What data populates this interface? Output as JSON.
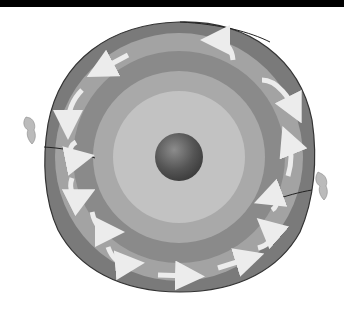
{
  "diagram": {
    "center": [
      179,
      157
    ],
    "layers": [
      {
        "name": "crust",
        "radius": 134,
        "color": "#7a7a7a"
      },
      {
        "name": "upper-mantle",
        "radius": 124,
        "color": "#a3a3a3"
      },
      {
        "name": "lower-mantle",
        "radius": 106,
        "color": "#8a8a8a"
      },
      {
        "name": "outer-core",
        "radius": 86,
        "color": "#a9a9a9"
      },
      {
        "name": "inner-region",
        "radius": 66,
        "color": "#c2c2c2"
      },
      {
        "name": "core",
        "radius": 24,
        "color": "#555555"
      }
    ],
    "arrow_color": "#ececec",
    "features": [
      "convection-arrows",
      "volcano-eruption-left",
      "volcano-eruption-right"
    ]
  }
}
